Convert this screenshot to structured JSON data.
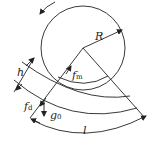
{
  "labels": {
    "radius": "R",
    "thickness": "h",
    "f_m": "f",
    "f_m_sub": "m",
    "f_d": "f",
    "f_d_sub": "d",
    "g_0": "g",
    "g_0_sub": "0",
    "length": "l"
  },
  "colors": {
    "stroke": "#222222",
    "background": "#ffffff"
  }
}
